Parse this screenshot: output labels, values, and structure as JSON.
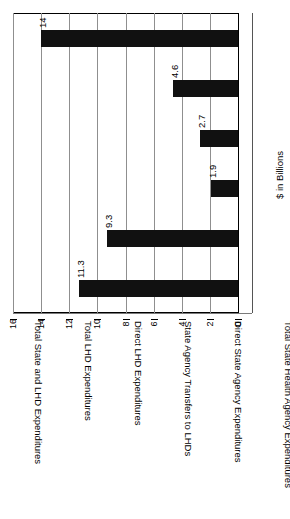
{
  "chart_data": {
    "type": "bar",
    "title": "",
    "xlabel": "",
    "ylabel": "$ in Billions",
    "ylim": [
      0,
      16
    ],
    "yticks": [
      0,
      2,
      4,
      6,
      8,
      10,
      12,
      14,
      16
    ],
    "grid": true,
    "legend": false,
    "orientation": "vertical-rotated",
    "bar_color": "#111111",
    "categories": [
      "Total State and LHD Expenditures",
      "Total LHD Expenditures",
      "Direct LHD Expenditures",
      "State Agency Transfers to LHDs",
      "Direct State Agency Expenditures",
      "Total State Health Agency Expenditures"
    ],
    "values": [
      14,
      4.6,
      2.7,
      1.9,
      9.3,
      11.3
    ],
    "value_labels": [
      "14",
      "4.6",
      "2.7",
      "1.9",
      "9.3",
      "11.3"
    ],
    "tick_labels": [
      "0",
      "2",
      "4",
      "6",
      "8",
      "10",
      "12",
      "14",
      "16"
    ]
  }
}
